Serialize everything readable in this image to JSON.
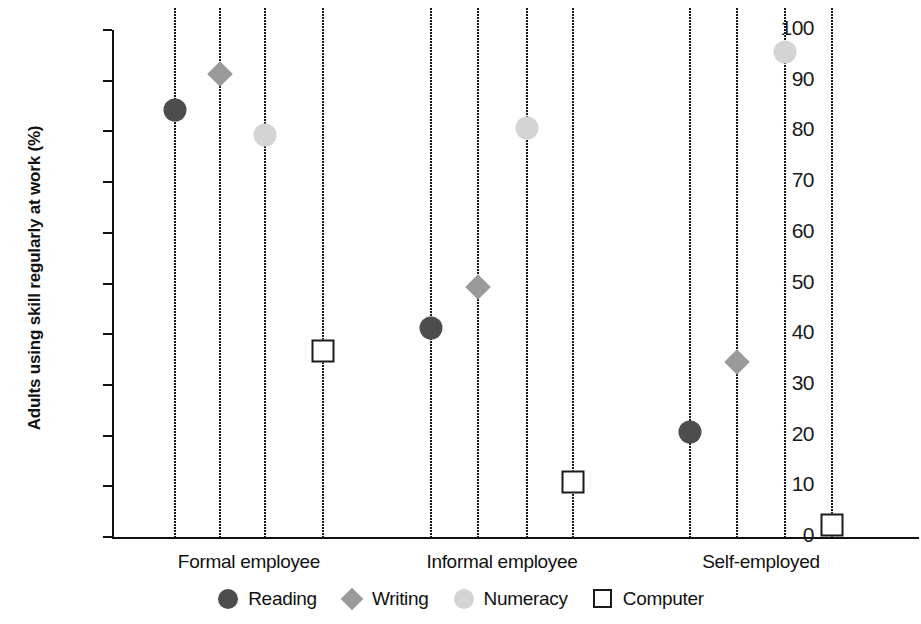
{
  "chart_data": {
    "type": "scatter",
    "title": "",
    "xlabel": "",
    "ylabel": "Adults using skill regularly at work (%)",
    "ylim": [
      0,
      100
    ],
    "yticks": [
      "0",
      "10",
      "20",
      "30",
      "40",
      "50",
      "60",
      "70",
      "80",
      "90",
      "100"
    ],
    "ytick_values": [
      0,
      10,
      20,
      30,
      40,
      50,
      60,
      70,
      80,
      90,
      100
    ],
    "grid": false,
    "legend_position": "bottom",
    "categories": [
      "Formal employee",
      "Informal employee",
      "Self-employed"
    ],
    "series": [
      {
        "name": "Reading",
        "marker": "circle-dark",
        "color": "#4d4d4d",
        "values": [
          84.2,
          41.3,
          20.8
        ]
      },
      {
        "name": "Writing",
        "marker": "diamond-gray",
        "color": "#9a9a9a",
        "values": [
          91.4,
          49.3,
          34.6
        ]
      },
      {
        "name": "Numeracy",
        "marker": "circle-light",
        "color": "#d4d4d4",
        "values": [
          79.2,
          80.7,
          95.7
        ]
      },
      {
        "name": "Computer",
        "marker": "square-hollow",
        "color": "#ffffff",
        "values": [
          36.6,
          10.8,
          2.4
        ]
      }
    ]
  },
  "legend": {
    "items": [
      {
        "label": "Reading"
      },
      {
        "label": "Writing"
      },
      {
        "label": "Numeracy"
      },
      {
        "label": "Computer"
      }
    ]
  },
  "axis": {
    "y_title": "Adults using skill regularly at work (%)"
  }
}
